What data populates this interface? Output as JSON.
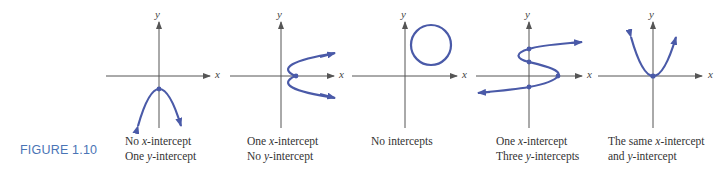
{
  "figure": {
    "label": "FIGURE 1.10",
    "label_color": "#4a74b5",
    "curve_color": "#4a5aa8",
    "axis_color": "#555555"
  },
  "panels": [
    {
      "id": "downward-parabola",
      "x_axis_label": "x",
      "y_axis_label": "y",
      "caption_line1": "No x-intercept",
      "caption_line2": "One y-intercept"
    },
    {
      "id": "sideways-parabola",
      "x_axis_label": "x",
      "y_axis_label": "y",
      "caption_line1": "One x-intercept",
      "caption_line2": "No y-intercept"
    },
    {
      "id": "circle",
      "x_axis_label": "x",
      "y_axis_label": "y",
      "caption_line1": "No intercepts",
      "caption_line2": ""
    },
    {
      "id": "s-curve",
      "x_axis_label": "x",
      "y_axis_label": "y",
      "caption_line1": "One x-intercept",
      "caption_line2": "Three y-intercepts"
    },
    {
      "id": "upward-parabola",
      "x_axis_label": "x",
      "y_axis_label": "y",
      "caption_line1": "The same x-intercept",
      "caption_line2": "and y-intercept"
    }
  ]
}
